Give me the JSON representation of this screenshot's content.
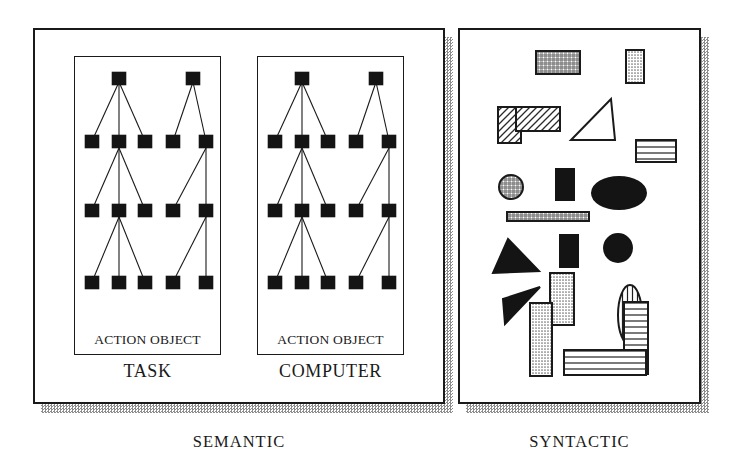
{
  "figure": {
    "title_left": "SEMANTIC",
    "title_right": "SYNTACTIC"
  },
  "colors": {
    "ink": "#1a1a1a",
    "paper": "#ffffff",
    "shadow": "#8d8d8d",
    "node_fill": "#141414",
    "stipple": "#b4b4b4"
  },
  "semantic_panel": {
    "name": "SEMANTIC",
    "caption": "SEMANTIC",
    "subpanels": [
      {
        "caption": "TASK",
        "inner_label": "ACTION OBJECT",
        "tree": {
          "levels": 4,
          "groups": [
            {
              "name": "ACTION",
              "nodes_per_level": [
                1,
                3,
                3,
                3
              ],
              "edges": "root-to-3, mid-to-3, mid-to-3"
            },
            {
              "name": "OBJECT",
              "nodes_per_level": [
                1,
                2,
                2,
                2
              ],
              "edges": "root-to-2, right-to-2, right-to-2"
            }
          ]
        }
      },
      {
        "caption": "COMPUTER",
        "inner_label": "ACTION OBJECT",
        "tree": {
          "levels": 4,
          "groups": [
            {
              "name": "ACTION",
              "nodes_per_level": [
                1,
                3,
                3,
                3
              ],
              "edges": "root-to-3, mid-to-3, mid-to-3"
            },
            {
              "name": "OBJECT",
              "nodes_per_level": [
                1,
                2,
                2,
                2
              ],
              "edges": "root-to-2, right-to-2, right-to-2"
            }
          ]
        }
      }
    ]
  },
  "syntactic_panel": {
    "name": "SYNTACTIC",
    "caption": "SYNTACTIC",
    "shapes": [
      {
        "id": "grid-rect-top",
        "type": "rect",
        "fill": "crosshatch"
      },
      {
        "id": "stipple-rect-topright",
        "type": "rect",
        "fill": "stipple"
      },
      {
        "id": "hatch-rect-small",
        "type": "rect",
        "fill": "diagonal"
      },
      {
        "id": "hatch-rect-wide",
        "type": "rect",
        "fill": "diagonal"
      },
      {
        "id": "triangle-outline",
        "type": "triangle",
        "fill": "none"
      },
      {
        "id": "hlines-rect-right",
        "type": "rect",
        "fill": "horizontal-lines"
      },
      {
        "id": "crosshatch-circle",
        "type": "circle",
        "fill": "crosshatch"
      },
      {
        "id": "black-rect-upper",
        "type": "rect",
        "fill": "solid"
      },
      {
        "id": "black-ellipse",
        "type": "ellipse",
        "fill": "solid"
      },
      {
        "id": "crosshatch-bar",
        "type": "rect",
        "fill": "crosshatch"
      },
      {
        "id": "black-rect-lower",
        "type": "rect",
        "fill": "solid"
      },
      {
        "id": "black-circle",
        "type": "circle",
        "fill": "solid"
      },
      {
        "id": "black-triangle",
        "type": "triangle",
        "fill": "solid"
      },
      {
        "id": "black-sliver",
        "type": "triangle",
        "fill": "solid"
      },
      {
        "id": "stipple-rect-tall",
        "type": "rect",
        "fill": "stipple"
      },
      {
        "id": "stipple-rect-tall2",
        "type": "rect",
        "fill": "stipple"
      },
      {
        "id": "vlines-ellipse",
        "type": "ellipse",
        "fill": "vertical-lines"
      },
      {
        "id": "hlines-rect-tall",
        "type": "rect",
        "fill": "horizontal-lines"
      },
      {
        "id": "hlines-rect-wide",
        "type": "rect",
        "fill": "horizontal-lines"
      }
    ]
  }
}
